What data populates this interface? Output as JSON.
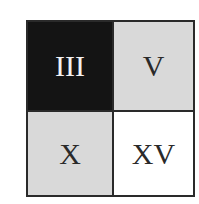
{
  "grid": {
    "rows": 2,
    "cols": 2,
    "border_color": "#2a2a2a",
    "cells": [
      {
        "label": "III",
        "background": "#141414",
        "text_color": "#f2f2f2"
      },
      {
        "label": "V",
        "background": "#d9d9d9",
        "text_color": "#2a2a2a"
      },
      {
        "label": "X",
        "background": "#d9d9d9",
        "text_color": "#2a2a2a"
      },
      {
        "label": "XV",
        "background": "#ffffff",
        "text_color": "#2a2a2a"
      }
    ]
  }
}
